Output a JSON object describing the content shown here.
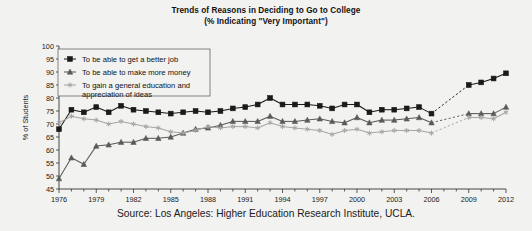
{
  "title": {
    "line1": "Trends of Reasons in Deciding to Go to College",
    "line2": "(% Indicating \"Very Important\")"
  },
  "source": "Source: Los Angeles: Higher Education Research Institute, UCLA.",
  "axes": {
    "ylabel": "% of Students",
    "xlabel": "",
    "yticks": [
      "45",
      "50",
      "55",
      "60",
      "65",
      "70",
      "75",
      "80",
      "85",
      "90",
      "95",
      "100"
    ],
    "xticks": [
      "1976",
      "1979",
      "1982",
      "1985",
      "1988",
      "1991",
      "1994",
      "1997",
      "2000",
      "2003",
      "2006",
      "2009",
      "2012"
    ]
  },
  "legend": {
    "items": [
      {
        "label": "To be able to get a better job",
        "marker": "square-marker",
        "color": "#1a1a1a"
      },
      {
        "label": "To be able to make more money",
        "marker": "triangle-marker",
        "color": "#5a5a5a"
      },
      {
        "label_line1": "To gain a general education and",
        "label_line2": "appreciation of ideas",
        "marker": "star-marker",
        "color": "#a6a6a6"
      }
    ]
  },
  "chart_data": {
    "type": "line",
    "title": "Trends of Reasons in Deciding to Go to College (% Indicating \"Very Important\")",
    "xlabel": "",
    "ylabel": "% of Students",
    "xlim": [
      1976,
      2012
    ],
    "ylim": [
      45,
      100
    ],
    "grid": false,
    "legend_position": "upper-left",
    "x": [
      1976,
      1977,
      1978,
      1979,
      1980,
      1981,
      1982,
      1983,
      1984,
      1985,
      1986,
      1987,
      1988,
      1989,
      1990,
      1991,
      1992,
      1993,
      1994,
      1995,
      1996,
      1997,
      1998,
      1999,
      2000,
      2001,
      2002,
      2003,
      2004,
      2005,
      2006,
      2009,
      2010,
      2011,
      2012
    ],
    "series": [
      {
        "name": "To be able to get a better job",
        "marker": "square",
        "color": "#1a1a1a",
        "gaps": [
          [
            1985,
            1988
          ],
          [
            2006,
            2009
          ]
        ],
        "values": [
          68.0,
          75.5,
          74.5,
          76.5,
          74.5,
          77.0,
          75.5,
          75.0,
          74.5,
          74.0,
          74.5,
          75.0,
          74.5,
          75.0,
          76.0,
          76.5,
          77.5,
          80.0,
          77.5,
          77.5,
          77.5,
          77.0,
          76.0,
          77.5,
          77.5,
          74.5,
          75.5,
          75.5,
          76.0,
          76.5,
          74.0,
          85.0,
          86.0,
          87.5,
          89.5
        ]
      },
      {
        "name": "To be able to make more money",
        "marker": "triangle",
        "color": "#5a5a5a",
        "gaps": [
          [
            2006,
            2009
          ]
        ],
        "values": [
          49.0,
          57.0,
          54.5,
          61.5,
          62.0,
          63.0,
          63.0,
          64.5,
          64.5,
          65.0,
          66.5,
          68.0,
          68.5,
          69.5,
          71.0,
          71.0,
          71.0,
          73.0,
          71.0,
          71.0,
          71.5,
          72.0,
          71.0,
          70.5,
          72.5,
          70.5,
          71.5,
          71.5,
          72.0,
          72.5,
          70.5,
          74.0,
          74.0,
          74.0,
          76.5
        ]
      },
      {
        "name": "To gain a general education and appreciation of ideas",
        "marker": "star",
        "color": "#a6a6a6",
        "gaps": [
          [
            2006,
            2009
          ]
        ],
        "values": [
          70.5,
          73.0,
          72.0,
          71.5,
          70.0,
          71.0,
          70.0,
          69.0,
          68.5,
          67.0,
          66.5,
          67.5,
          69.0,
          68.5,
          69.0,
          69.0,
          68.5,
          70.5,
          69.0,
          68.5,
          68.0,
          67.5,
          66.0,
          67.5,
          68.0,
          66.5,
          67.0,
          67.5,
          67.5,
          67.5,
          66.5,
          72.5,
          72.5,
          72.0,
          74.5
        ]
      }
    ]
  }
}
